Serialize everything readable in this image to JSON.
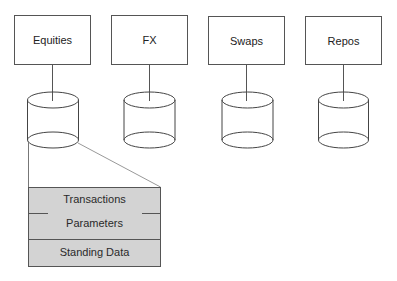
{
  "diagram": {
    "type": "system-architecture",
    "systems": [
      {
        "label": "Equities",
        "box": {
          "x": 14,
          "y": 15,
          "w": 77,
          "h": 50
        },
        "db_center_x": 53
      },
      {
        "label": "FX",
        "box": {
          "x": 111,
          "y": 15,
          "w": 77,
          "h": 50
        },
        "db_center_x": 149.5
      },
      {
        "label": "Swaps",
        "box": {
          "x": 208,
          "y": 16,
          "w": 77,
          "h": 49
        },
        "db_center_x": 247.5
      },
      {
        "label": "Repos",
        "box": {
          "x": 305,
          "y": 16,
          "w": 77,
          "h": 49
        },
        "db_center_x": 343.5
      }
    ],
    "database": {
      "rx": 25.5,
      "ry": 8,
      "top_cy": 100,
      "bottom_cy": 140,
      "icon": "database-cylinder-icon"
    },
    "detail_table": {
      "expands_from": "Equities",
      "rows": [
        {
          "label": "Transactions"
        },
        {
          "label": "Parameters"
        },
        {
          "label": "Standing Data"
        }
      ]
    },
    "colors": {
      "stroke": "#555555",
      "projection_line": "#999999",
      "table_fill": "#d3d3d3",
      "text": "#222222"
    }
  }
}
